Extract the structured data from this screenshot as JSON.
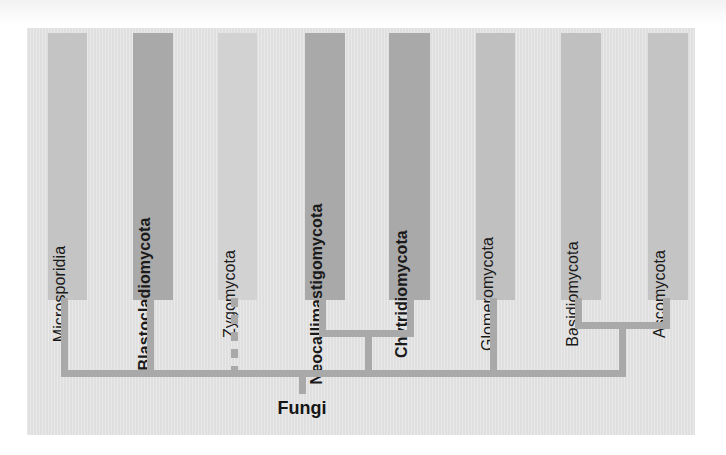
{
  "figure": {
    "kind": "phylogenetic-tree",
    "root_label": "Fungi",
    "panel_color": "#e3e3e3",
    "branch_color": "#a9a9a9",
    "background_color": "#ffffff"
  },
  "taxa": [
    {
      "name": "Microsporidia",
      "bold": false,
      "bar_color": "#c4c4c4",
      "bar": {
        "x": 48,
        "y": 33,
        "w": 39,
        "h": 267
      },
      "stem_x": 64,
      "label_rotation": -90
    },
    {
      "name": "Blastocladiomycota",
      "bold": true,
      "bar_color": "#a9a9a9",
      "bar": {
        "x": 133,
        "y": 33,
        "w": 40,
        "h": 267
      },
      "stem_x": 150,
      "label_rotation": -90
    },
    {
      "name": "Zygomycota",
      "bold": false,
      "bar_color": "#d2d2d2",
      "bar": {
        "x": 218,
        "y": 33,
        "w": 39,
        "h": 267
      },
      "stem_x": 234,
      "branch_style": "dashed",
      "label_rotation": -90
    },
    {
      "name": "Neocallimastigomycota",
      "bold": true,
      "bar_color": "#a9a9a9",
      "bar": {
        "x": 305,
        "y": 33,
        "w": 40,
        "h": 267
      },
      "stem_x": 322,
      "label_rotation": -90
    },
    {
      "name": "Chytridiomycota",
      "bold": true,
      "bar_color": "#a9a9a9",
      "bar": {
        "x": 389,
        "y": 33,
        "w": 41,
        "h": 267
      },
      "stem_x": 410,
      "label_rotation": -90
    },
    {
      "name": "Glomeromycota",
      "bold": false,
      "bar_color": "#c0c0c0",
      "bar": {
        "x": 476,
        "y": 33,
        "w": 39,
        "h": 267
      },
      "stem_x": 493,
      "label_rotation": -90
    },
    {
      "name": "Basidiomycota",
      "bold": false,
      "bar_color": "#c0c0c0",
      "bar": {
        "x": 561,
        "y": 33,
        "w": 40,
        "h": 267
      },
      "stem_x": 578,
      "label_rotation": -90
    },
    {
      "name": "Ascomycota",
      "bold": false,
      "bar_color": "#c4c4c4",
      "bar": {
        "x": 648,
        "y": 33,
        "w": 40,
        "h": 267
      },
      "stem_x": 666,
      "label_rotation": -90
    }
  ],
  "clades": [
    {
      "id": "neocallimastigomycota-chytridiomycota",
      "members": [
        "Neocallimastigomycota",
        "Chytridiomycota"
      ],
      "crossbar_y": 330,
      "stem_x": 368
    },
    {
      "id": "basidiomycota-ascomycota",
      "members": [
        "Basidiomycota",
        "Ascomycota"
      ],
      "crossbar_y": 322,
      "stem_x": 622
    }
  ],
  "trunk": {
    "y": 370,
    "x_start": 61,
    "x_end": 625,
    "thickness": 7
  },
  "root_stem": {
    "x": 302,
    "y_top": 370,
    "height": 24,
    "thickness": 7
  }
}
